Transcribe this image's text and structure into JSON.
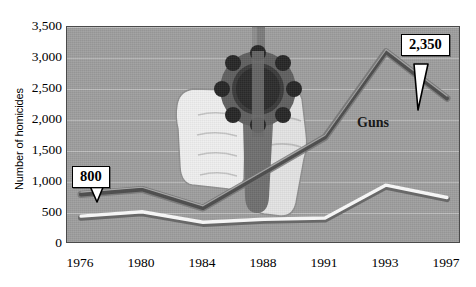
{
  "chart_data": {
    "type": "line",
    "title": "",
    "xlabel": "",
    "ylabel": "Number of homicides",
    "categories": [
      "1976",
      "1980",
      "1984",
      "1988",
      "1991",
      "1993",
      "1997"
    ],
    "ylim": [
      0,
      3500
    ],
    "ytick_labels": [
      "0",
      "500",
      "1,000",
      "1,500",
      "2,000",
      "2,500",
      "3,000",
      "3,500"
    ],
    "ytick_values": [
      0,
      500,
      1000,
      1500,
      2000,
      2500,
      3000,
      3500
    ],
    "grid": true,
    "legend": "inline-series-labels",
    "series": [
      {
        "name": "Guns",
        "color": "#5c5c5c",
        "values": [
          800,
          880,
          580,
          1150,
          1720,
          3100,
          2350
        ]
      },
      {
        "name": "Other weapons",
        "color": "#f2f2f2",
        "values": [
          450,
          520,
          350,
          400,
          420,
          950,
          750
        ]
      }
    ],
    "annotations": [
      {
        "text": "800",
        "series": "Guns",
        "category": "1976",
        "value": 800
      },
      {
        "text": "2,350",
        "series": "Guns",
        "category": "1997",
        "value": 2350
      }
    ],
    "illustration": "revolver-held-in-hands"
  },
  "axis": {
    "y_title": "Number of homicides"
  },
  "labels": {
    "guns": "Guns",
    "other_weapons": "Other weapons"
  },
  "callouts": {
    "first": "800",
    "last": "2,350"
  },
  "colors": {
    "plot_background": "#9e9e9e",
    "guns_line": "#5c5c5c",
    "other_line": "#f2f2f2",
    "text": "#000000"
  }
}
